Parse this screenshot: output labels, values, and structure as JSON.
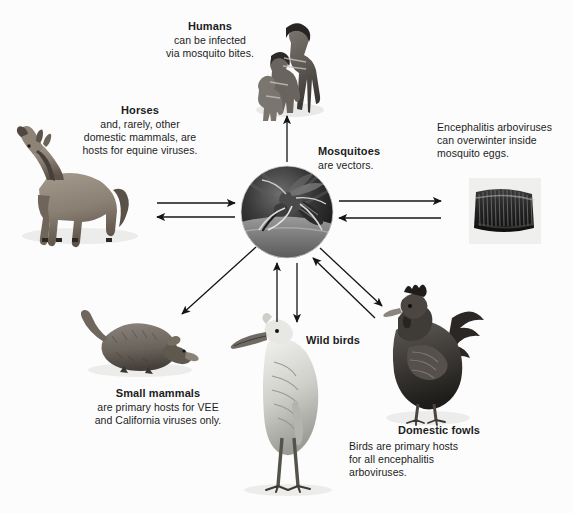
{
  "diagram": {
    "background_color": "#fcfcfc",
    "text_color": "#1c1c1c",
    "nodes": {
      "humans": {
        "title": "Humans",
        "line1": "can be infected",
        "line2": "via mosquito bites.",
        "icon": "human-photo",
        "align": "center"
      },
      "horses": {
        "title": "Horses",
        "line1": "and, rarely, other",
        "line2": "domestic mammals, are",
        "line3": "hosts for equine viruses.",
        "icon": "horse-photo",
        "align": "center"
      },
      "mosquitoes": {
        "title": "Mosquitoes",
        "line1": "are vectors.",
        "icon": "mosquito-photo",
        "align": "left"
      },
      "encephalitis": {
        "line1": "Encephalitis arboviruses",
        "line2": "can overwinter inside",
        "line3": "mosquito eggs.",
        "icon": "mosquito-eggs-photo",
        "align": "left"
      },
      "small_mammals": {
        "title": "Small mammals",
        "line1": "are primary hosts for VEE",
        "line2": "and California viruses only.",
        "icon": "shrew-photo",
        "align": "center"
      },
      "wild_birds": {
        "title": "Wild birds",
        "icon": "heron-photo",
        "align": "left"
      },
      "domestic_fowls": {
        "title": "Domestic fowls",
        "line1": "Birds are primary hosts",
        "line2": "for all encephalitis",
        "line3": "arboviruses.",
        "icon": "rooster-photo",
        "align": "left"
      }
    },
    "arrows": [
      {
        "name": "mosquitoes-to-humans",
        "direction": "one-way",
        "from": "mosquitoes",
        "to": "humans"
      },
      {
        "name": "mosquitoes-horses",
        "direction": "two-way",
        "from": "mosquitoes",
        "to": "horses"
      },
      {
        "name": "mosquitoes-encephalitis-eggs",
        "direction": "two-way",
        "from": "mosquitoes",
        "to": "encephalitis"
      },
      {
        "name": "mosquitoes-to-small-mammals",
        "direction": "one-way",
        "from": "mosquitoes",
        "to": "small_mammals"
      },
      {
        "name": "mosquitoes-wild-birds",
        "direction": "two-way",
        "from": "mosquitoes",
        "to": "wild_birds"
      },
      {
        "name": "mosquitoes-domestic-fowls",
        "direction": "two-way",
        "from": "mosquitoes",
        "to": "domestic_fowls"
      }
    ]
  }
}
